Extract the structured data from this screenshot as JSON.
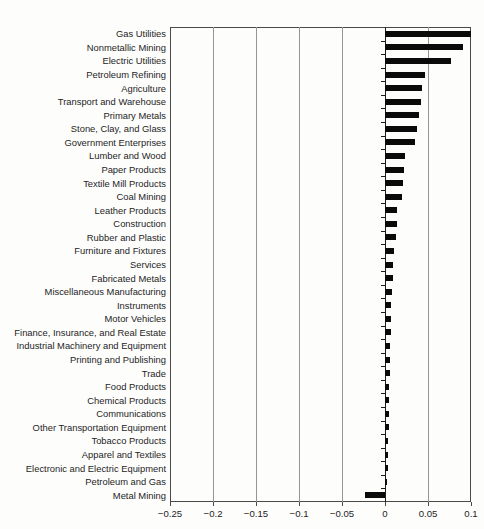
{
  "chart_data": {
    "type": "bar",
    "orientation": "horizontal",
    "title": "",
    "categories": [
      "Gas Utilities",
      "Nonmetallic Mining",
      "Electric Utilities",
      "Petroleum Refining",
      "Agriculture",
      "Transport and Warehouse",
      "Primary Metals",
      "Stone, Clay, and Glass",
      "Government Enterprises",
      "Lumber and Wood",
      "Paper Products",
      "Textile Mill Products",
      "Coal Mining",
      "Leather Products",
      "Construction",
      "Rubber and Plastic",
      "Furniture and Fixtures",
      "Services",
      "Fabricated Metals",
      "Miscellaneous Manufacturing",
      "Instruments",
      "Motor Vehicles",
      "Finance, Insurance, and Real Estate",
      "Industrial Machinery and Equipment",
      "Printing and Publishing",
      "Trade",
      "Food Products",
      "Chemical Products",
      "Communications",
      "Other Transportation Equipment",
      "Tobacco Products",
      "Apparel and Textiles",
      "Electronic and Electric Equipment",
      "Petroleum and Gas",
      "Metal Mining"
    ],
    "values": [
      0.1,
      0.091,
      0.077,
      0.046,
      0.043,
      0.042,
      0.039,
      0.037,
      0.035,
      0.023,
      0.0225,
      0.021,
      0.02,
      0.0145,
      0.014,
      0.0125,
      0.01,
      0.009,
      0.0088,
      0.008,
      0.0075,
      0.007,
      0.0065,
      0.006,
      0.0055,
      0.0053,
      0.005,
      0.0048,
      0.0045,
      0.0042,
      0.004,
      0.0037,
      0.0035,
      0.002,
      -0.023
    ],
    "xlabel": "",
    "ylabel": "",
    "xlim": [
      -0.25,
      0.1
    ],
    "xticks": [
      -0.25,
      -0.2,
      -0.15,
      -0.1,
      -0.05,
      0,
      0.05,
      0.1
    ],
    "xtick_labels": [
      "−0.25",
      "−0.2",
      "−0.15",
      "−0.1",
      "−0.05",
      "0",
      "0.05",
      "0.1"
    ],
    "grid": "vertical gridlines at every x tick, zero line drawn as category axis",
    "legend": "none",
    "bar_color": "#0a0a0a",
    "frame_color": "#4a4a4a",
    "gridline_color": "#969696",
    "axis_color": "#1c1c1c",
    "text_color": "#1e1e1e"
  }
}
